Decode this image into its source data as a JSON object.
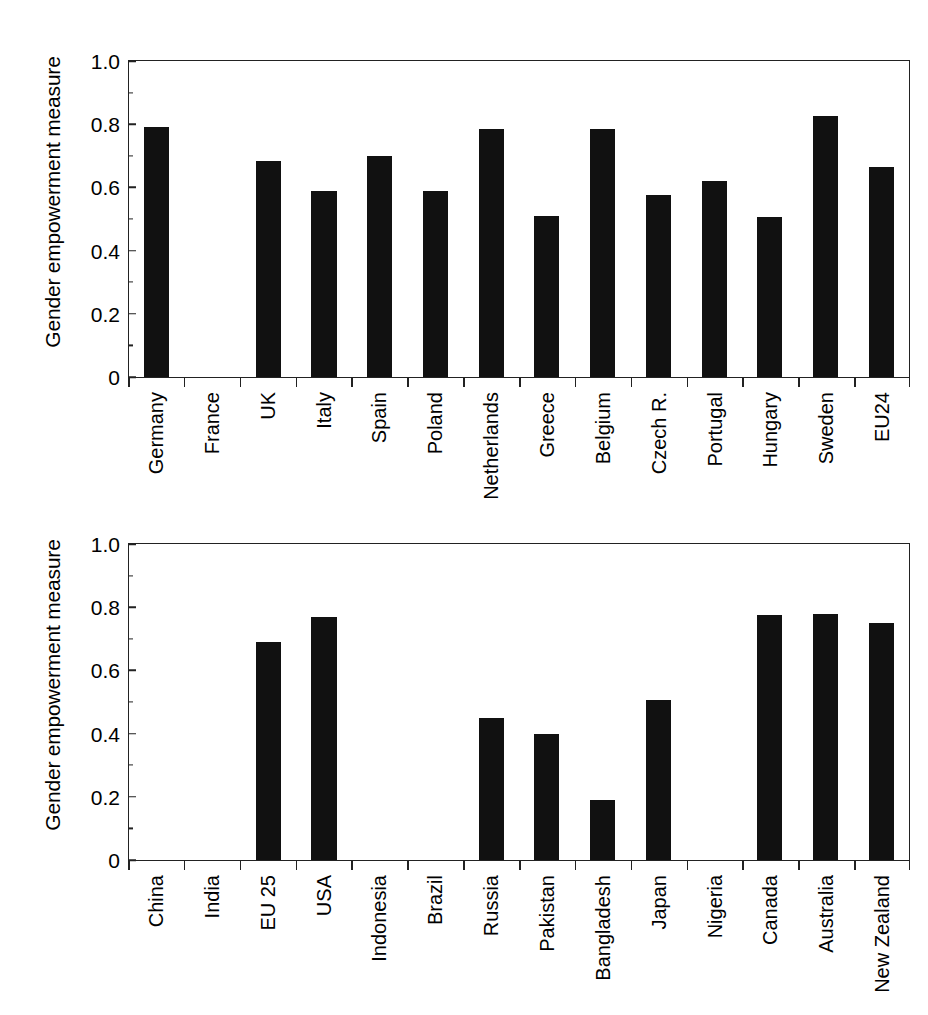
{
  "figure": {
    "caption_partial": "",
    "bar_color": "#111111",
    "axis_color": "#222222"
  },
  "chart_data": [
    {
      "type": "bar",
      "title": "",
      "xlabel": "",
      "ylabel": "Gender empowerment measure",
      "ylim": [
        0,
        1.0
      ],
      "ytick_labels": [
        "0",
        "0.2",
        "0.4",
        "0.6",
        "0.8",
        "1.0"
      ],
      "ytick_values": [
        0,
        0.2,
        0.4,
        0.6,
        0.8,
        1.0
      ],
      "grid": false,
      "legend": "none",
      "categories": [
        "Germany",
        "France",
        "UK",
        "Italy",
        "Spain",
        "Poland",
        "Netherlands",
        "Greece",
        "Belgium",
        "Czech R.",
        "Portugal",
        "Hungary",
        "Sweden",
        "EU24"
      ],
      "values": [
        0.79,
        null,
        0.685,
        0.59,
        0.7,
        0.59,
        0.785,
        0.51,
        0.785,
        0.575,
        0.62,
        0.505,
        0.825,
        0.665
      ]
    },
    {
      "type": "bar",
      "title": "",
      "xlabel": "",
      "ylabel": "Gender empowerment measure",
      "ylim": [
        0,
        1.0
      ],
      "ytick_labels": [
        "0",
        "0.2",
        "0.4",
        "0.6",
        "0.8",
        "1.0"
      ],
      "ytick_values": [
        0,
        0.2,
        0.4,
        0.6,
        0.8,
        1.0
      ],
      "grid": false,
      "legend": "none",
      "categories": [
        "China",
        "India",
        "EU 25",
        "USA",
        "Indonesia",
        "Brazil",
        "Russia",
        "Pakistan",
        "Bangladesh",
        "Japan",
        "Nigeria",
        "Canada",
        "Australia",
        "New Zealand"
      ],
      "values": [
        null,
        null,
        0.69,
        0.77,
        null,
        null,
        0.45,
        0.4,
        0.19,
        0.505,
        null,
        0.775,
        0.78,
        0.75
      ]
    }
  ]
}
